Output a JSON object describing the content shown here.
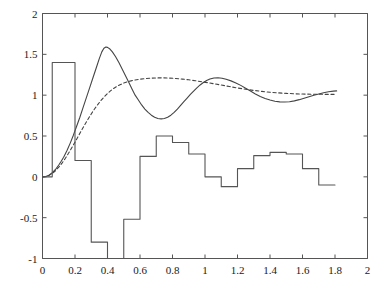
{
  "figure": {
    "background": "#ffffff",
    "axis_color": "#555555",
    "series_color": "#444444"
  },
  "chart_data": {
    "type": "line",
    "title": "",
    "xlabel": "",
    "ylabel": "",
    "xlim": [
      0,
      2
    ],
    "ylim": [
      -1,
      2
    ],
    "grid": false,
    "legend": null,
    "xticks": [
      0,
      0.2,
      0.4,
      0.6,
      0.8,
      1,
      1.2,
      1.4,
      1.6,
      1.8,
      2
    ],
    "xtick_labels": [
      "0",
      "0.2",
      "0.4",
      "0.6",
      "0.8",
      "1",
      "1.2",
      "1.4",
      "1.6",
      "1.8",
      "2"
    ],
    "yticks": [
      -1,
      -0.5,
      0,
      0.5,
      1,
      1.5,
      2
    ],
    "ytick_labels": [
      "-1",
      "-0.5",
      "0",
      "0.5",
      "1",
      "1.5",
      "2"
    ],
    "series": [
      {
        "name": "oscillatory-response",
        "style": "solid",
        "color": "#444444",
        "points": [
          [
            0.0,
            0.0
          ],
          [
            0.02,
            0.005
          ],
          [
            0.04,
            0.02
          ],
          [
            0.06,
            0.05
          ],
          [
            0.08,
            0.09
          ],
          [
            0.1,
            0.145
          ],
          [
            0.115,
            0.19
          ],
          [
            0.13,
            0.24
          ],
          [
            0.15,
            0.32
          ],
          [
            0.17,
            0.41
          ],
          [
            0.19,
            0.51
          ],
          [
            0.21,
            0.62
          ],
          [
            0.23,
            0.73
          ],
          [
            0.25,
            0.85
          ],
          [
            0.27,
            0.97
          ],
          [
            0.29,
            1.09
          ],
          [
            0.31,
            1.21
          ],
          [
            0.33,
            1.33
          ],
          [
            0.35,
            1.45
          ],
          [
            0.365,
            1.53
          ],
          [
            0.378,
            1.575
          ],
          [
            0.39,
            1.59
          ],
          [
            0.4,
            1.585
          ],
          [
            0.415,
            1.565
          ],
          [
            0.43,
            1.53
          ],
          [
            0.45,
            1.47
          ],
          [
            0.47,
            1.4
          ],
          [
            0.49,
            1.32
          ],
          [
            0.51,
            1.24
          ],
          [
            0.53,
            1.16
          ],
          [
            0.55,
            1.08
          ],
          [
            0.57,
            1.0
          ],
          [
            0.59,
            0.94
          ],
          [
            0.61,
            0.88
          ],
          [
            0.63,
            0.83
          ],
          [
            0.65,
            0.79
          ],
          [
            0.67,
            0.755
          ],
          [
            0.69,
            0.73
          ],
          [
            0.71,
            0.715
          ],
          [
            0.73,
            0.71
          ],
          [
            0.75,
            0.715
          ],
          [
            0.77,
            0.73
          ],
          [
            0.79,
            0.755
          ],
          [
            0.81,
            0.79
          ],
          [
            0.83,
            0.83
          ],
          [
            0.85,
            0.875
          ],
          [
            0.87,
            0.92
          ],
          [
            0.89,
            0.965
          ],
          [
            0.91,
            1.01
          ],
          [
            0.93,
            1.05
          ],
          [
            0.95,
            1.09
          ],
          [
            0.97,
            1.125
          ],
          [
            0.99,
            1.155
          ],
          [
            1.01,
            1.18
          ],
          [
            1.03,
            1.198
          ],
          [
            1.055,
            1.21
          ],
          [
            1.08,
            1.213
          ],
          [
            1.105,
            1.207
          ],
          [
            1.13,
            1.195
          ],
          [
            1.16,
            1.175
          ],
          [
            1.19,
            1.15
          ],
          [
            1.22,
            1.12
          ],
          [
            1.25,
            1.085
          ],
          [
            1.28,
            1.05
          ],
          [
            1.31,
            1.015
          ],
          [
            1.34,
            0.985
          ],
          [
            1.37,
            0.96
          ],
          [
            1.4,
            0.94
          ],
          [
            1.43,
            0.925
          ],
          [
            1.46,
            0.918
          ],
          [
            1.49,
            0.916
          ],
          [
            1.52,
            0.92
          ],
          [
            1.55,
            0.93
          ],
          [
            1.58,
            0.945
          ],
          [
            1.61,
            0.962
          ],
          [
            1.64,
            0.98
          ],
          [
            1.67,
            0.998
          ],
          [
            1.7,
            1.015
          ],
          [
            1.73,
            1.03
          ],
          [
            1.76,
            1.042
          ],
          [
            1.79,
            1.05
          ],
          [
            1.81,
            1.052
          ]
        ]
      },
      {
        "name": "smoothed-response",
        "style": "dashed",
        "color": "#444444",
        "points": [
          [
            0.0,
            0.0
          ],
          [
            0.02,
            0.004
          ],
          [
            0.04,
            0.018
          ],
          [
            0.06,
            0.042
          ],
          [
            0.08,
            0.075
          ],
          [
            0.1,
            0.118
          ],
          [
            0.12,
            0.168
          ],
          [
            0.14,
            0.225
          ],
          [
            0.16,
            0.288
          ],
          [
            0.18,
            0.355
          ],
          [
            0.2,
            0.425
          ],
          [
            0.22,
            0.497
          ],
          [
            0.24,
            0.568
          ],
          [
            0.26,
            0.638
          ],
          [
            0.28,
            0.705
          ],
          [
            0.3,
            0.77
          ],
          [
            0.32,
            0.83
          ],
          [
            0.34,
            0.885
          ],
          [
            0.36,
            0.935
          ],
          [
            0.38,
            0.98
          ],
          [
            0.4,
            1.02
          ],
          [
            0.42,
            1.055
          ],
          [
            0.44,
            1.085
          ],
          [
            0.46,
            1.11
          ],
          [
            0.48,
            1.13
          ],
          [
            0.5,
            1.148
          ],
          [
            0.52,
            1.162
          ],
          [
            0.545,
            1.175
          ],
          [
            0.57,
            1.186
          ],
          [
            0.6,
            1.196
          ],
          [
            0.63,
            1.203
          ],
          [
            0.66,
            1.208
          ],
          [
            0.7,
            1.211
          ],
          [
            0.74,
            1.212
          ],
          [
            0.78,
            1.209
          ],
          [
            0.82,
            1.204
          ],
          [
            0.86,
            1.197
          ],
          [
            0.9,
            1.188
          ],
          [
            0.94,
            1.177
          ],
          [
            0.98,
            1.165
          ],
          [
            1.02,
            1.152
          ],
          [
            1.06,
            1.138
          ],
          [
            1.1,
            1.124
          ],
          [
            1.15,
            1.106
          ],
          [
            1.2,
            1.088
          ],
          [
            1.25,
            1.072
          ],
          [
            1.3,
            1.058
          ],
          [
            1.35,
            1.046
          ],
          [
            1.4,
            1.036
          ],
          [
            1.45,
            1.028
          ],
          [
            1.5,
            1.022
          ],
          [
            1.55,
            1.017
          ],
          [
            1.6,
            1.014
          ],
          [
            1.65,
            1.012
          ],
          [
            1.7,
            1.011
          ],
          [
            1.75,
            1.01
          ],
          [
            1.81,
            1.01
          ]
        ]
      },
      {
        "name": "step-control-signal",
        "style": "step",
        "color": "#555555",
        "step_edges": [
          0.0,
          0.06,
          0.1,
          0.2,
          0.24,
          0.3,
          0.4,
          0.44,
          0.5,
          0.56,
          0.6,
          0.7,
          0.76,
          0.8,
          0.86,
          0.9,
          0.96,
          1.0,
          1.06,
          1.1,
          1.16,
          1.2,
          1.26,
          1.3,
          1.36,
          1.4,
          1.46,
          1.5,
          1.56,
          1.6,
          1.66,
          1.7,
          1.8
        ],
        "step_values": [
          0.0,
          1.4,
          1.4,
          0.2,
          0.2,
          -0.8,
          -1.0,
          -1.0,
          -0.52,
          -0.52,
          0.25,
          0.5,
          0.5,
          0.42,
          0.42,
          0.28,
          0.28,
          0.0,
          0.0,
          -0.12,
          -0.12,
          0.1,
          0.1,
          0.26,
          0.26,
          0.3,
          0.3,
          0.28,
          0.28,
          0.1,
          0.1,
          -0.1,
          -0.1
        ]
      }
    ]
  }
}
